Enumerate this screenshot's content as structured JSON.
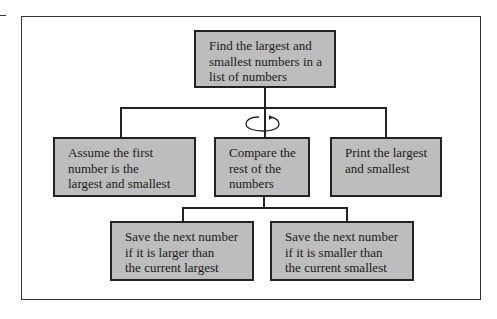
{
  "diagram": {
    "type": "hierarchy-chart",
    "root": {
      "label": "Find the largest and smallest numbers in a list of numbers",
      "lines": [
        "Find the largest and",
        "smallest numbers in a",
        "list of numbers"
      ]
    },
    "level2": [
      {
        "label": "Assume the first number is the largest and smallest",
        "lines": [
          "Assume the first",
          "number is the",
          "largest and smallest"
        ]
      },
      {
        "label": "Compare the rest of the numbers",
        "lines": [
          "Compare the",
          "rest of the",
          "numbers"
        ],
        "repeat": true
      },
      {
        "label": "Print the largest and smallest",
        "lines": [
          "Print the largest",
          "and smallest"
        ]
      }
    ],
    "level3": [
      {
        "label": "Save the next number if it is larger than the current largest",
        "lines": [
          "Save the next number",
          "if it is larger than",
          "the current largest"
        ]
      },
      {
        "label": "Save the next number if it is smaller than the current smallest",
        "lines": [
          "Save the next number",
          "if it is smaller than",
          "the current smallest"
        ]
      }
    ],
    "icons": {
      "repeat": "loop-arrow-icon"
    },
    "colors": {
      "box_fill": "#bdbdbd",
      "line": "#222222"
    }
  }
}
